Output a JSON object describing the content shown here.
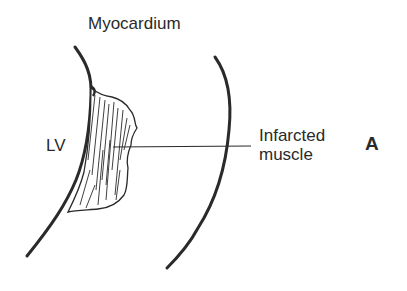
{
  "figure": {
    "panel_letter": "A",
    "labels": {
      "myocardium": "Myocardium",
      "lv": "LV",
      "infarcted_line1": "Infarcted",
      "infarcted_line2": "muscle"
    },
    "colors": {
      "stroke": "#2a2a2a",
      "background": "#ffffff"
    }
  }
}
